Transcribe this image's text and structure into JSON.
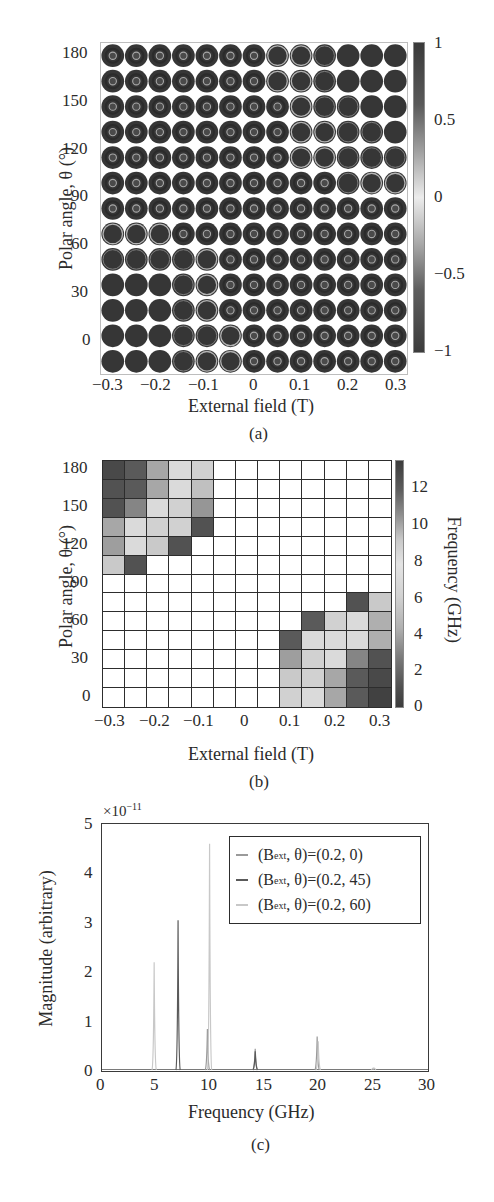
{
  "chart_data": [
    {
      "panel": "(a)",
      "type": "heatmap",
      "title": "",
      "subtitle": "",
      "xlabel": "External field (T)",
      "ylabel": "Polar angle, θ (°)",
      "x": [
        -0.3,
        -0.25,
        -0.2,
        -0.15,
        -0.1,
        -0.05,
        0,
        0.05,
        0.1,
        0.15,
        0.2,
        0.25,
        0.3
      ],
      "y": [
        180,
        165,
        150,
        135,
        120,
        105,
        90,
        75,
        60,
        45,
        30,
        15,
        0
      ],
      "xticks": [
        "−0.3",
        "−0.2",
        "−0.1",
        "0",
        "0.1",
        "0.2",
        "0.3"
      ],
      "yticks": [
        "180",
        "150",
        "120",
        "90",
        "60",
        "30",
        "0"
      ],
      "xlim": [
        -0.3,
        0.3
      ],
      "ylim": [
        0,
        180
      ],
      "colorbar": {
        "ticks": [
          "1",
          "0.5",
          "0",
          "−0.5",
          "−1"
        ],
        "range": [
          -1,
          1
        ]
      },
      "cell_states_note": "each cell is a disk magnetization map; states: core = vortex with small bright core ring, ring = large bright outer ring, faint = faint outer ring, solid = uniform",
      "cell_states": [
        [
          "core",
          "core",
          "core",
          "core",
          "core",
          "core",
          "core",
          "ring",
          "ring",
          "faint",
          "solid",
          "solid",
          "solid"
        ],
        [
          "core",
          "core",
          "core",
          "core",
          "core",
          "core",
          "core",
          "ring",
          "ring",
          "faint",
          "solid",
          "solid",
          "solid"
        ],
        [
          "core",
          "core",
          "core",
          "core",
          "core",
          "core",
          "core",
          "core",
          "ring",
          "faint",
          "faint",
          "solid",
          "solid"
        ],
        [
          "core",
          "core",
          "core",
          "core",
          "core",
          "core",
          "core",
          "core",
          "ring",
          "ring",
          "faint",
          "faint",
          "solid"
        ],
        [
          "core",
          "core",
          "core",
          "core",
          "core",
          "core",
          "core",
          "core",
          "ring",
          "ring",
          "faint",
          "faint",
          "faint"
        ],
        [
          "core",
          "core",
          "core",
          "core",
          "core",
          "core",
          "core",
          "core",
          "core",
          "core",
          "faint",
          "ring",
          "ring"
        ],
        [
          "core",
          "core",
          "core",
          "core",
          "core",
          "core",
          "core",
          "core",
          "core",
          "core",
          "core",
          "core",
          "core"
        ],
        [
          "ring",
          "ring",
          "ring",
          "core",
          "core",
          "core",
          "core",
          "core",
          "core",
          "core",
          "core",
          "core",
          "core"
        ],
        [
          "faint",
          "faint",
          "faint",
          "faint",
          "ring",
          "core",
          "core",
          "core",
          "core",
          "core",
          "core",
          "core",
          "core"
        ],
        [
          "solid",
          "solid",
          "solid",
          "faint",
          "ring",
          "core",
          "core",
          "core",
          "core",
          "core",
          "core",
          "core",
          "core"
        ],
        [
          "solid",
          "solid",
          "solid",
          "faint",
          "ring",
          "core",
          "core",
          "core",
          "core",
          "core",
          "core",
          "core",
          "core"
        ],
        [
          "solid",
          "solid",
          "solid",
          "faint",
          "faint",
          "ring",
          "core",
          "core",
          "core",
          "core",
          "core",
          "core",
          "core"
        ],
        [
          "solid",
          "solid",
          "solid",
          "faint",
          "ring",
          "ring",
          "core",
          "core",
          "core",
          "core",
          "core",
          "core",
          "core"
        ]
      ],
      "grid": false,
      "caption": "(a)"
    },
    {
      "panel": "(b)",
      "type": "heatmap",
      "title": "",
      "subtitle": "",
      "xlabel": "External field (T)",
      "ylabel": "Polar angle, θ (°)",
      "x": [
        -0.3,
        -0.25,
        -0.2,
        -0.15,
        -0.1,
        -0.05,
        0,
        0.05,
        0.1,
        0.15,
        0.2,
        0.25,
        0.3
      ],
      "y": [
        180,
        165,
        150,
        135,
        120,
        105,
        90,
        75,
        60,
        45,
        30,
        15,
        0
      ],
      "xticks": [
        "−0.3",
        "−0.2",
        "−0.1",
        "0",
        "0.1",
        "0.2",
        "0.3"
      ],
      "yticks": [
        "180",
        "150",
        "120",
        "90",
        "60",
        "30",
        "0"
      ],
      "xlim": [
        -0.3,
        0.3
      ],
      "ylim": [
        0,
        180
      ],
      "colorbar": {
        "label": "Frequency (GHz)",
        "ticks": [
          "12",
          "10",
          "8",
          "6",
          "4",
          "2",
          "0"
        ],
        "range": [
          0,
          13.5
        ]
      },
      "values_note": "frequency in GHz, rows top (180°) to bottom (0°); null = blank (no mode)",
      "values": [
        [
          12.5,
          11.5,
          7,
          4,
          4.5,
          null,
          null,
          null,
          null,
          null,
          null,
          null,
          null
        ],
        [
          12,
          11.5,
          7,
          4,
          5.5,
          null,
          null,
          null,
          null,
          null,
          null,
          null,
          null
        ],
        [
          12,
          9,
          4,
          4.5,
          8,
          null,
          null,
          null,
          null,
          null,
          null,
          null,
          null
        ],
        [
          7,
          4,
          4.5,
          4.5,
          12,
          null,
          null,
          null,
          null,
          null,
          null,
          null,
          null
        ],
        [
          7.5,
          4,
          5,
          12,
          null,
          null,
          null,
          null,
          null,
          null,
          null,
          null,
          null
        ],
        [
          5,
          12,
          null,
          null,
          null,
          null,
          null,
          null,
          null,
          null,
          null,
          null,
          null
        ],
        [
          null,
          null,
          null,
          null,
          null,
          null,
          null,
          null,
          null,
          null,
          null,
          null,
          null
        ],
        [
          null,
          null,
          null,
          null,
          null,
          null,
          null,
          null,
          null,
          null,
          null,
          12,
          5
        ],
        [
          null,
          null,
          null,
          null,
          null,
          null,
          null,
          null,
          null,
          11.5,
          4.5,
          4,
          6.5
        ],
        [
          null,
          null,
          null,
          null,
          null,
          null,
          null,
          null,
          11.5,
          4,
          4,
          4,
          6.5
        ],
        [
          null,
          null,
          null,
          null,
          null,
          null,
          null,
          null,
          7.5,
          4.5,
          4,
          9,
          12
        ],
        [
          null,
          null,
          null,
          null,
          null,
          null,
          null,
          null,
          5,
          4.5,
          7,
          11.5,
          12.5
        ],
        [
          null,
          null,
          null,
          null,
          null,
          null,
          null,
          null,
          4.5,
          4,
          7,
          11.5,
          13
        ]
      ],
      "grid": true,
      "caption": "(b)"
    },
    {
      "panel": "(c)",
      "type": "line",
      "title": "",
      "subtitle": "",
      "xlabel": "Frequency (GHz)",
      "ylabel": "Magnitude (arbitrary)",
      "y_multiplier": "×10⁻¹¹",
      "xlim": [
        0,
        30
      ],
      "ylim": [
        0,
        5
      ],
      "xticks": [
        "0",
        "5",
        "10",
        "15",
        "20",
        "25",
        "30"
      ],
      "yticks": [
        "5",
        "4",
        "3",
        "2",
        "1",
        "0"
      ],
      "grid": false,
      "legend_position": "upper right",
      "series": [
        {
          "name": "(Bext, θ)=(0.2, 0)",
          "color": "#9a9a9a",
          "peaks": [
            {
              "x": 9.7,
              "y": 0.85
            },
            {
              "x": 14.1,
              "y": 0.45
            },
            {
              "x": 19.8,
              "y": 0.7
            }
          ]
        },
        {
          "name": "(Bext, θ)=(0.2, 45)",
          "color": "#5a5a5a",
          "peaks": [
            {
              "x": 7.0,
              "y": 3.05
            },
            {
              "x": 14.1,
              "y": 0.4
            }
          ]
        },
        {
          "name": "(Bext, θ)=(0.2, 60)",
          "color": "#c8c8c8",
          "peaks": [
            {
              "x": 4.8,
              "y": 2.2
            },
            {
              "x": 9.9,
              "y": 4.6
            },
            {
              "x": 19.9,
              "y": 0.6
            },
            {
              "x": 25,
              "y": 0.05
            }
          ]
        }
      ],
      "caption": "(c)"
    }
  ],
  "panel_a": {
    "ylabel": "Polar angle, θ (°)",
    "xlabel": "External field (T)",
    "caption": "(a)",
    "yticks": [
      "180",
      "150",
      "120",
      "90",
      "60",
      "30",
      "0"
    ],
    "xticks": [
      "−0.3",
      "−0.2",
      "−0.1",
      "0",
      "0.1",
      "0.2",
      "0.3"
    ],
    "cbar_ticks": [
      "1",
      "0.5",
      "0",
      "−0.5",
      "−1"
    ]
  },
  "panel_b": {
    "ylabel": "Polar angle, θ (°)",
    "xlabel": "External field (T)",
    "caption": "(b)",
    "cbar_label": "Frequency (GHz)",
    "yticks": [
      "180",
      "150",
      "120",
      "90",
      "60",
      "30",
      "0"
    ],
    "xticks": [
      "−0.3",
      "−0.2",
      "−0.1",
      "0",
      "0.1",
      "0.2",
      "0.3"
    ],
    "cbar_ticks": [
      "12",
      "10",
      "8",
      "6",
      "4",
      "2",
      "0"
    ]
  },
  "panel_c": {
    "ylabel": "Magnitude (arbitrary)",
    "xlabel": "Frequency (GHz)",
    "caption": "(c)",
    "multiplier": "×10",
    "multiplier_exp": "−11",
    "yticks": [
      "5",
      "4",
      "3",
      "2",
      "1",
      "0"
    ],
    "xticks": [
      "0",
      "5",
      "10",
      "15",
      "20",
      "25",
      "30"
    ],
    "legend": [
      {
        "prefix": "(B",
        "sub": "ext",
        "suffix": ", θ)=(0.2, 0)",
        "color": "#9a9a9a"
      },
      {
        "prefix": "(B",
        "sub": "ext",
        "suffix": ", θ)=(0.2, 45)",
        "color": "#5a5a5a"
      },
      {
        "prefix": "(B",
        "sub": "ext",
        "suffix": ", θ)=(0.2, 60)",
        "color": "#c8c8c8"
      }
    ]
  }
}
